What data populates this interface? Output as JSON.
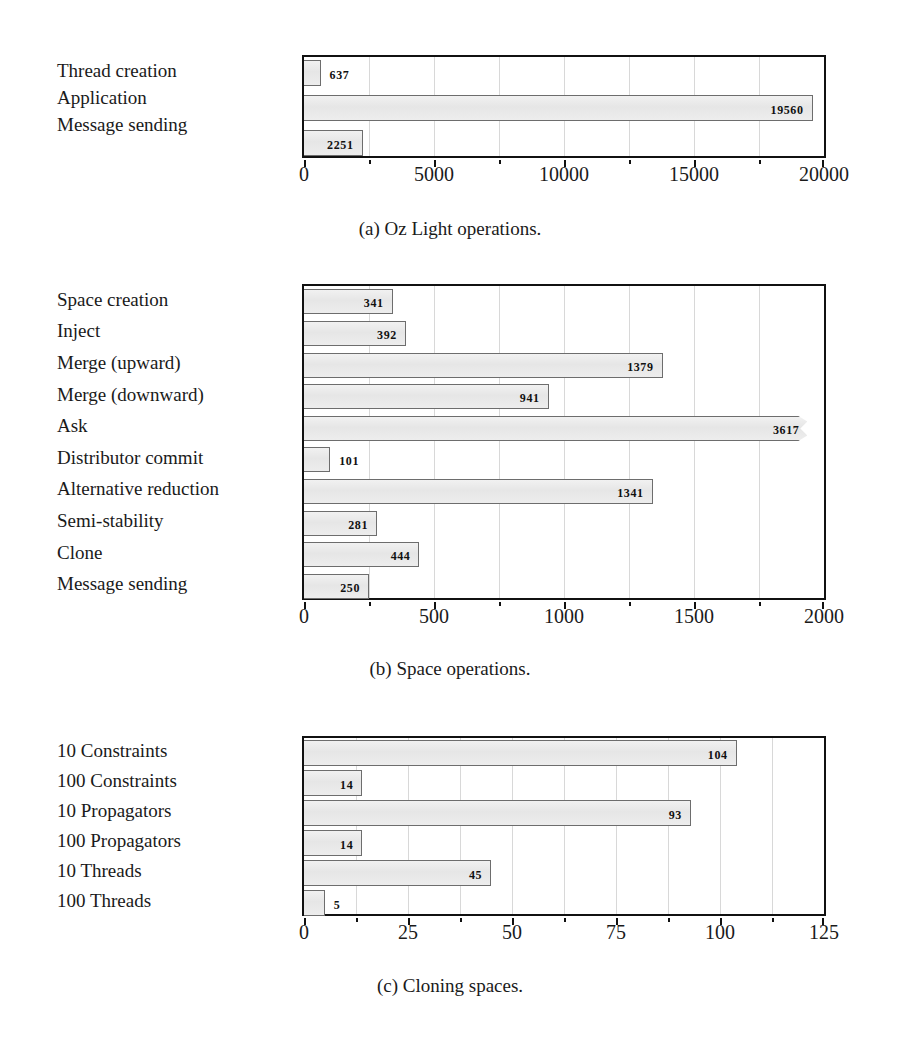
{
  "page": {
    "background": "#ffffff",
    "bar_fill": "#e9e9e9",
    "bar_border": "#6d6d6d",
    "frame_color": "#111111"
  },
  "charts": [
    {
      "id": "oz-light-operations",
      "caption": "(a) Oz Light operations.",
      "chart_data": {
        "type": "bar",
        "orientation": "horizontal",
        "title": "(a) Oz Light operations.",
        "xlabel": "",
        "ylabel": "",
        "categories": [
          "Thread creation",
          "Application",
          "Message sending"
        ],
        "values": [
          637,
          19560,
          2251
        ],
        "value_labels": [
          "637",
          "19560",
          "2251"
        ],
        "xlim": [
          0,
          20000
        ],
        "xticks": [
          0,
          5000,
          10000,
          15000,
          20000
        ],
        "xtick_labels": [
          "0",
          "5000",
          "10000",
          "15000",
          "20000"
        ],
        "minor_xticks": [
          2500,
          7500,
          12500,
          17500
        ],
        "grid": true,
        "legend": "none"
      }
    },
    {
      "id": "space-operations",
      "caption": "(b) Space operations.",
      "chart_data": {
        "type": "bar",
        "orientation": "horizontal",
        "title": "(b) Space operations.",
        "xlabel": "",
        "ylabel": "",
        "categories": [
          "Space creation",
          "Inject",
          "Merge (upward)",
          "Merge (downward)",
          "Ask",
          "Distributor commit",
          "Alternative reduction",
          "Semi-stability",
          "Clone",
          "Message sending"
        ],
        "values": [
          341,
          392,
          1379,
          941,
          3617,
          101,
          1341,
          281,
          444,
          250
        ],
        "value_labels": [
          "341",
          "392",
          "1379",
          "941",
          "3617",
          "101",
          "1341",
          "281",
          "444",
          "250"
        ],
        "clipped": [
          "Ask"
        ],
        "xlim": [
          0,
          2000
        ],
        "xticks": [
          0,
          500,
          1000,
          1500,
          2000
        ],
        "xtick_labels": [
          "0",
          "500",
          "1000",
          "1500",
          "2000"
        ],
        "minor_xticks": [
          250,
          750,
          1250,
          1750
        ],
        "grid": true,
        "legend": "none"
      }
    },
    {
      "id": "cloning-spaces",
      "caption": "(c) Cloning spaces.",
      "chart_data": {
        "type": "bar",
        "orientation": "horizontal",
        "title": "(c) Cloning spaces.",
        "xlabel": "",
        "ylabel": "",
        "categories": [
          "10 Constraints",
          "100 Constraints",
          "10 Propagators",
          "100 Propagators",
          "10 Threads",
          "100 Threads"
        ],
        "values": [
          104,
          14,
          93,
          14,
          45,
          5
        ],
        "value_labels": [
          "104",
          "14",
          "93",
          "14",
          "45",
          "5"
        ],
        "xlim": [
          0,
          125
        ],
        "xticks": [
          0,
          25,
          50,
          75,
          100,
          125
        ],
        "xtick_labels": [
          "0",
          "25",
          "50",
          "75",
          "100",
          "125"
        ],
        "minor_xticks": [
          12.5,
          37.5,
          62.5,
          87.5,
          112.5
        ],
        "grid": true,
        "legend": "none"
      }
    }
  ]
}
